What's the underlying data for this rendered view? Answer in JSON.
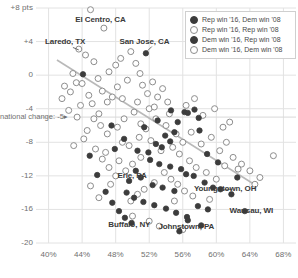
{
  "chart_data": {
    "type": "scatter",
    "title": "",
    "subtitle": "",
    "xlabel": "",
    "ylabel": "",
    "xlim": [
      38.5,
      69.5
    ],
    "ylim": [
      -20,
      8
    ],
    "grid": true,
    "legend_position": "top-right",
    "y_ticks": [
      {
        "value": 8,
        "label": "+8 pts"
      },
      {
        "value": 4,
        "label": "+4"
      },
      {
        "value": 0,
        "label": "0"
      },
      {
        "value": -4,
        "label": "-4"
      },
      {
        "value": -8,
        "label": "-8"
      },
      {
        "value": -12,
        "label": "-12"
      },
      {
        "value": -16,
        "label": "-16"
      },
      {
        "value": -20,
        "label": "-20"
      }
    ],
    "x_ticks": [
      {
        "value": 40,
        "label": "40%"
      },
      {
        "value": 44,
        "label": "44%"
      },
      {
        "value": 48,
        "label": "48%"
      },
      {
        "value": 52,
        "label": "52%"
      },
      {
        "value": 56,
        "label": "56%"
      },
      {
        "value": 60,
        "label": "60%"
      },
      {
        "value": 64,
        "label": "64%"
      },
      {
        "value": 68,
        "label": "68%"
      }
    ],
    "reference_line": {
      "value": -5,
      "label": "national change: -5"
    },
    "legend": [
      {
        "marker": "filled",
        "label": "Rep win '16, Dem win '08"
      },
      {
        "marker": "hollow",
        "label": "Rep win '16, Rep win '08"
      },
      {
        "marker": "filled",
        "label": "Dem win '16, Rep win '08"
      },
      {
        "marker": "hollow",
        "label": "Dem win '16, Dem win '08"
      }
    ],
    "annotations": [
      {
        "label": "El Centro, CA",
        "x": 46.6,
        "y": 6.6
      },
      {
        "label": "Laredo, TX",
        "x": 42.2,
        "y": 3.9
      },
      {
        "label": "San Jose, CA",
        "x": 51.6,
        "y": 4.0
      },
      {
        "label": "Erie, PA",
        "x": 50.3,
        "y": -12.0
      },
      {
        "label": "Youngstown, OH",
        "x": 61.0,
        "y": -13.6
      },
      {
        "label": "Buffalo, NY",
        "x": 50.0,
        "y": -17.9
      },
      {
        "label": "Johnstown, PA",
        "x": 56.5,
        "y": -18.1
      },
      {
        "label": "Wausau, WI",
        "x": 64.2,
        "y": -16.2
      }
    ],
    "trendline": {
      "x1": 41.0,
      "y1": 1.8,
      "x2": 64.5,
      "y2": -13.0
    },
    "series": [
      {
        "name": "Rep win '16, Dem win '08",
        "marker": "filled",
        "points": [
          [
            44.1,
            0.1
          ],
          [
            51.6,
            2.6
          ],
          [
            47.5,
            -6.0
          ],
          [
            54.6,
            -4.2
          ],
          [
            56.2,
            -4.4
          ],
          [
            56.6,
            -4.5
          ],
          [
            57.4,
            -4.1
          ],
          [
            57.9,
            -5.1
          ],
          [
            58.0,
            -6.6
          ],
          [
            55.0,
            -6.8
          ],
          [
            53.9,
            -7.2
          ],
          [
            54.5,
            -7.9
          ],
          [
            52.8,
            -8.2
          ],
          [
            53.5,
            -8.6
          ],
          [
            51.9,
            -9.2
          ],
          [
            50.6,
            -9.0
          ],
          [
            52.1,
            -10.1
          ],
          [
            53.2,
            -10.6
          ],
          [
            54.5,
            -10.9
          ],
          [
            55.8,
            -11.2
          ],
          [
            56.4,
            -11.8
          ],
          [
            50.4,
            -11.4
          ],
          [
            51.0,
            -12.2
          ],
          [
            49.6,
            -12.6
          ],
          [
            52.4,
            -13.1
          ],
          [
            53.6,
            -13.4
          ],
          [
            55.0,
            -13.8
          ],
          [
            57.3,
            -12.0
          ],
          [
            58.6,
            -12.8
          ],
          [
            59.6,
            -13.4
          ],
          [
            60.5,
            -13.6
          ],
          [
            61.8,
            -14.2
          ],
          [
            49.3,
            -14.0
          ],
          [
            50.2,
            -14.6
          ],
          [
            51.3,
            -15.1
          ],
          [
            52.6,
            -15.5
          ],
          [
            54.0,
            -15.9
          ],
          [
            55.2,
            -16.4
          ],
          [
            56.5,
            -16.9
          ],
          [
            57.8,
            -15.6
          ],
          [
            59.0,
            -16.0
          ],
          [
            63.4,
            -16.2
          ],
          [
            48.4,
            -16.2
          ],
          [
            49.1,
            -17.0
          ],
          [
            49.9,
            -17.6
          ],
          [
            56.6,
            -17.3
          ],
          [
            55.6,
            -18.6
          ],
          [
            58.2,
            -17.9
          ],
          [
            47.6,
            -15.2
          ],
          [
            46.8,
            -13.9
          ],
          [
            45.8,
            -11.9
          ],
          [
            62.5,
            -12.2
          ],
          [
            44.9,
            -9.6
          ],
          [
            53.0,
            -5.4
          ],
          [
            55.4,
            -5.6
          ],
          [
            51.4,
            -6.2
          ],
          [
            49.0,
            -7.6
          ],
          [
            47.9,
            -8.8
          ],
          [
            58.9,
            -9.4
          ],
          [
            60.2,
            -10.4
          ]
        ]
      },
      {
        "name": "Rep win '16, Rep win '08",
        "marker": "hollow",
        "points": [
          [
            45.0,
            7.8
          ],
          [
            43.6,
            3.1
          ],
          [
            44.4,
            2.4
          ],
          [
            45.4,
            1.6
          ],
          [
            42.9,
            0.2
          ],
          [
            43.3,
            -0.9
          ],
          [
            41.9,
            -1.3
          ],
          [
            42.6,
            -2.0
          ],
          [
            44.0,
            -1.0
          ],
          [
            44.8,
            -2.4
          ],
          [
            45.9,
            -0.4
          ],
          [
            46.4,
            -1.9
          ],
          [
            47.0,
            -3.2
          ],
          [
            45.2,
            -3.4
          ],
          [
            43.8,
            -3.6
          ],
          [
            46.0,
            -4.6
          ],
          [
            47.6,
            -2.6
          ],
          [
            48.2,
            -1.4
          ],
          [
            48.8,
            -2.8
          ],
          [
            49.4,
            -0.6
          ],
          [
            47.2,
            0.4
          ],
          [
            48.0,
            1.2
          ],
          [
            48.6,
            2.0
          ],
          [
            49.8,
            2.8
          ],
          [
            50.4,
            1.4
          ],
          [
            50.9,
            0.2
          ],
          [
            51.2,
            -1.2
          ],
          [
            51.8,
            -2.2
          ],
          [
            52.4,
            -0.8
          ],
          [
            53.0,
            -2.6
          ],
          [
            53.6,
            -1.6
          ],
          [
            54.2,
            -3.2
          ],
          [
            52.0,
            -4.0
          ],
          [
            50.2,
            -4.4
          ],
          [
            49.0,
            -5.2
          ],
          [
            48.2,
            -6.2
          ],
          [
            47.0,
            -7.0
          ],
          [
            46.2,
            -6.0
          ],
          [
            45.4,
            -5.2
          ],
          [
            44.6,
            -6.6
          ],
          [
            43.4,
            -5.0
          ],
          [
            42.4,
            -4.2
          ],
          [
            46.8,
            -9.2
          ],
          [
            48.4,
            -10.2
          ],
          [
            49.6,
            -8.4
          ],
          [
            50.8,
            -7.4
          ],
          [
            51.6,
            -6.4
          ],
          [
            52.8,
            -5.2
          ],
          [
            54.0,
            -6.0
          ],
          [
            55.2,
            -7.0
          ],
          [
            56.0,
            -8.0
          ],
          [
            57.0,
            -6.8
          ],
          [
            58.2,
            -8.2
          ],
          [
            59.4,
            -7.4
          ],
          [
            60.4,
            -9.0
          ],
          [
            61.2,
            -8.0
          ],
          [
            62.0,
            -9.8
          ],
          [
            63.0,
            -10.6
          ],
          [
            64.0,
            -11.4
          ],
          [
            65.2,
            -12.2
          ],
          [
            66.8,
            -9.6
          ],
          [
            55.6,
            -9.4
          ],
          [
            54.8,
            -8.6
          ],
          [
            53.4,
            -9.0
          ],
          [
            52.2,
            -7.8
          ],
          [
            51.0,
            -9.8
          ],
          [
            50.0,
            -10.6
          ],
          [
            49.2,
            -11.4
          ],
          [
            48.0,
            -12.0
          ],
          [
            47.2,
            -11.0
          ],
          [
            46.4,
            -10.0
          ],
          [
            45.6,
            -8.8
          ],
          [
            56.8,
            -10.2
          ],
          [
            57.6,
            -11.0
          ],
          [
            58.8,
            -11.6
          ],
          [
            60.0,
            -12.4
          ],
          [
            53.8,
            -11.6
          ],
          [
            54.6,
            -12.4
          ],
          [
            55.4,
            -13.0
          ],
          [
            56.2,
            -13.8
          ],
          [
            52.6,
            -12.8
          ],
          [
            51.4,
            -13.6
          ],
          [
            50.6,
            -14.2
          ],
          [
            49.8,
            -15.0
          ],
          [
            55.0,
            -15.0
          ],
          [
            57.2,
            -14.4
          ],
          [
            59.2,
            -14.8
          ],
          [
            61.0,
            -10.8
          ],
          [
            62.6,
            -11.2
          ],
          [
            64.6,
            -13.0
          ],
          [
            59.8,
            -4.0
          ],
          [
            61.6,
            -5.6
          ],
          [
            57.4,
            -2.8
          ],
          [
            56.4,
            -3.6
          ],
          [
            58.4,
            -4.8
          ],
          [
            60.8,
            -6.2
          ],
          [
            50.0,
            -16.8
          ],
          [
            52.0,
            -17.4
          ],
          [
            53.2,
            -18.0
          ],
          [
            56.0,
            -18.4
          ],
          [
            46.6,
            5.6
          ],
          [
            44.2,
            -7.6
          ],
          [
            43.0,
            -8.4
          ],
          [
            41.6,
            -2.8
          ],
          [
            45.0,
            -13.2
          ],
          [
            46.0,
            -14.6
          ],
          [
            47.4,
            -13.0
          ],
          [
            48.8,
            -8.0
          ],
          [
            50.6,
            -3.2
          ],
          [
            52.6,
            -3.8
          ],
          [
            54.4,
            -4.6
          ],
          [
            51.0,
            -5.8
          ]
        ]
      }
    ]
  }
}
